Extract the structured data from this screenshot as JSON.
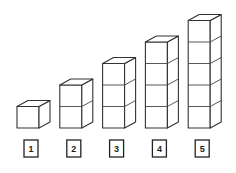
{
  "diagram": {
    "stroke_color": "#333333",
    "background": "#ffffff",
    "stacks": [
      {
        "label": "1",
        "cubes": 1
      },
      {
        "label": "2",
        "cubes": 2
      },
      {
        "label": "3",
        "cubes": 3
      },
      {
        "label": "4",
        "cubes": 4
      },
      {
        "label": "5",
        "cubes": 5
      }
    ]
  }
}
